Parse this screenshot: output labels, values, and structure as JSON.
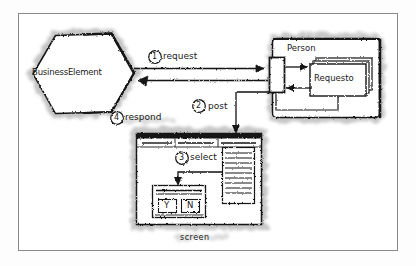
{
  "diagram": {
    "title_present": false,
    "style": "hand-drawn sketch UML collaboration diagram",
    "frame": {
      "name": "outer-frame"
    },
    "nodes": {
      "business_element": {
        "label": "BusinessElement",
        "shape": "hexagon"
      },
      "person_boundary": {
        "label": "Person",
        "shape": "rounded-rectangle"
      },
      "requestor_card": {
        "label": "Requesto",
        "shape": "stacked-cards",
        "stack_count": 3
      },
      "port": {
        "label": "",
        "shape": "small-rectangle-port"
      },
      "screen": {
        "label": "screen",
        "shape": "window-mockup",
        "menubar_segments": 3,
        "list_panel_lines": 9,
        "dialog": {
          "title_lines": 2,
          "buttons": [
            {
              "label": "Y"
            },
            {
              "label": "N"
            }
          ]
        }
      }
    },
    "messages": [
      {
        "number": "1",
        "glyph": "①",
        "label": "request",
        "from": "business_element",
        "to": "person_boundary"
      },
      {
        "number": "2",
        "glyph": "②",
        "label": "post",
        "from": "person_boundary",
        "to": "screen"
      },
      {
        "number": "3",
        "glyph": "③",
        "label": "select",
        "from": "list_panel",
        "to": "dialog"
      },
      {
        "number": "4",
        "glyph": "④",
        "label": "respond",
        "from": "screen",
        "to": "business_element"
      }
    ],
    "colors": {
      "ink": "#1a1a1a",
      "paper": "#ffffff",
      "frame_border": "#8a8a8a",
      "shadow": "#b8b8b8"
    }
  }
}
